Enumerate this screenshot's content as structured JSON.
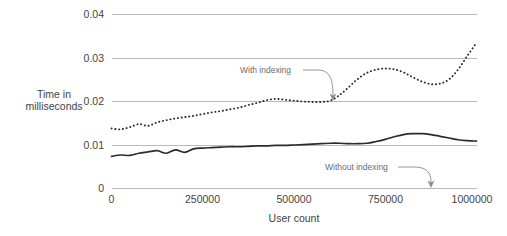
{
  "chart_data": {
    "type": "line",
    "title": "",
    "xlabel": "User count",
    "ylabel": "Time in milliseconds",
    "ylabel_line1": "Time in",
    "ylabel_line2": "milliseconds",
    "xlim": [
      0,
      1000000
    ],
    "ylim": [
      0,
      0.04
    ],
    "grid": true,
    "gridlines_y": [
      0,
      0.01,
      0.02,
      0.03,
      0.04
    ],
    "legend_position": "inline-annotations",
    "xticks": [
      0,
      250000,
      500000,
      750000,
      1000000
    ],
    "xtick_labels": [
      "0",
      "250000",
      "500000",
      "750000",
      "1000000"
    ],
    "yticks": [
      0,
      0.01,
      0.02,
      0.03,
      0.04
    ],
    "ytick_labels": [
      "0",
      "0.01",
      "0.02",
      "0.03",
      "0.04"
    ],
    "annotations": [
      {
        "id": "with-indexing",
        "text": "With indexing",
        "points_to_series": "With indexing",
        "points_to_x": 530000,
        "points_to_y": 0.0205
      },
      {
        "id": "without-indexing",
        "text": "Without indexing",
        "points_to_series": "Without indexing",
        "points_to_x": 880000,
        "points_to_y": 0.0
      }
    ],
    "x": [
      0,
      25000,
      50000,
      75000,
      100000,
      125000,
      150000,
      175000,
      200000,
      225000,
      250000,
      275000,
      300000,
      325000,
      350000,
      375000,
      400000,
      425000,
      450000,
      475000,
      500000,
      525000,
      550000,
      575000,
      600000,
      625000,
      650000,
      675000,
      700000,
      725000,
      750000,
      775000,
      800000,
      825000,
      850000,
      875000,
      900000,
      925000,
      950000,
      975000,
      1000000
    ],
    "series": [
      {
        "name": "With indexing",
        "style": "dotted",
        "color": "#2b2b2b",
        "values": [
          0.0138,
          0.0136,
          0.0141,
          0.0148,
          0.0144,
          0.0152,
          0.0157,
          0.0161,
          0.0164,
          0.0167,
          0.0171,
          0.0175,
          0.0178,
          0.0182,
          0.0186,
          0.0192,
          0.0197,
          0.0203,
          0.0206,
          0.0204,
          0.0202,
          0.02,
          0.0199,
          0.0199,
          0.0202,
          0.0215,
          0.0233,
          0.0252,
          0.0266,
          0.0273,
          0.0276,
          0.0274,
          0.0267,
          0.0256,
          0.0246,
          0.024,
          0.0241,
          0.0251,
          0.0274,
          0.0305,
          0.0335
        ]
      },
      {
        "name": "Without indexing",
        "style": "solid",
        "color": "#2b2b2b",
        "values": [
          0.0074,
          0.0077,
          0.0076,
          0.0081,
          0.0084,
          0.0087,
          0.0081,
          0.0089,
          0.0083,
          0.0091,
          0.0093,
          0.0094,
          0.0095,
          0.0096,
          0.0096,
          0.0097,
          0.0098,
          0.0098,
          0.0099,
          0.0099,
          0.01,
          0.0101,
          0.0102,
          0.0103,
          0.0104,
          0.0104,
          0.0103,
          0.0103,
          0.0104,
          0.0108,
          0.0113,
          0.0119,
          0.0124,
          0.0126,
          0.0126,
          0.0124,
          0.012,
          0.0116,
          0.0112,
          0.011,
          0.0109
        ]
      }
    ]
  },
  "colors": {
    "gridline": "#b9b9b9",
    "series": "#2b2b2b",
    "leader": "#8a8a8a",
    "text": "#3f3f3f",
    "annotation_text": "#6c6c6c",
    "background": "#ffffff"
  }
}
